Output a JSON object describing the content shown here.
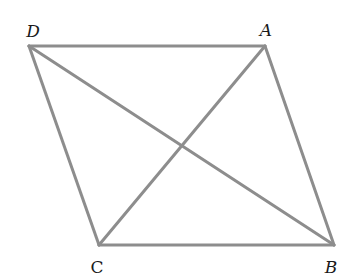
{
  "diagram": {
    "type": "parallelogram-with-diagonals",
    "line_color": "#8d8d8d",
    "vertices": {
      "D": {
        "x": 29,
        "y": 46,
        "label": "D",
        "lx": 33,
        "ly": 37
      },
      "A": {
        "x": 265,
        "y": 46,
        "label": "A",
        "lx": 266,
        "ly": 36
      },
      "C": {
        "x": 99,
        "y": 245,
        "label": "C",
        "lx": 97,
        "ly": 273
      },
      "B": {
        "x": 334,
        "y": 245,
        "label": "B",
        "lx": 331,
        "ly": 273
      }
    },
    "edges": [
      [
        "D",
        "A"
      ],
      [
        "A",
        "B"
      ],
      [
        "B",
        "C"
      ],
      [
        "C",
        "D"
      ]
    ],
    "diagonals": [
      [
        "D",
        "B"
      ],
      [
        "A",
        "C"
      ]
    ]
  }
}
